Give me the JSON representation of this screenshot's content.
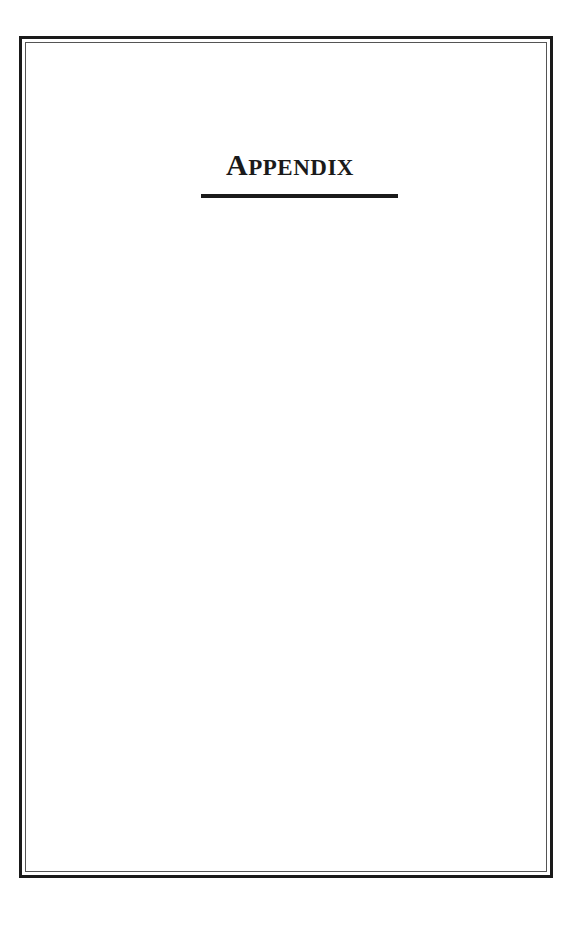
{
  "page": {
    "heading": {
      "first_letter": "A",
      "rest": "PPENDIX",
      "full_text": "APPENDIX"
    }
  },
  "colors": {
    "ink": "#1a1a1a",
    "background": "#ffffff"
  }
}
